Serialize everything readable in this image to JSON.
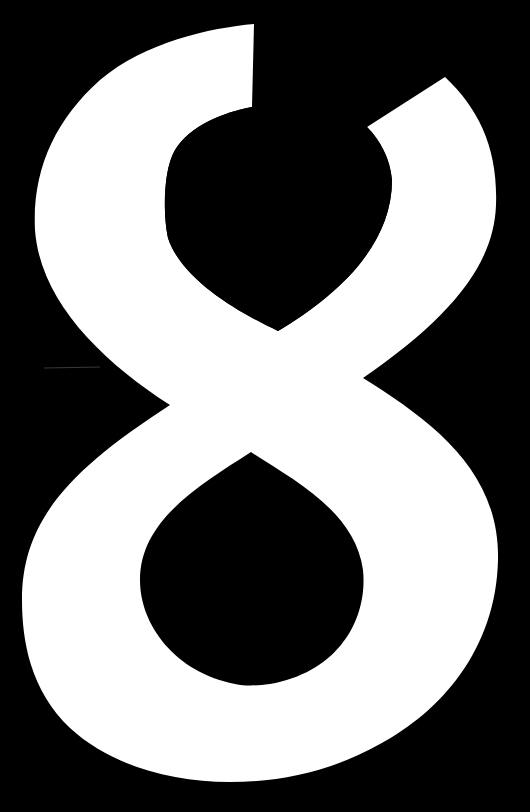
{
  "image": {
    "description": "Large white stylized numeral eight on a solid black background",
    "glyph": "8",
    "colors": {
      "background": "#000000",
      "glyph": "#ffffff"
    }
  }
}
